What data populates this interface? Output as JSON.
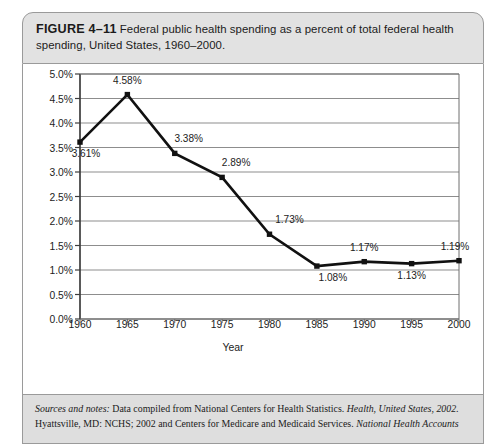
{
  "figure": {
    "label": "FIGURE 4–11",
    "caption": "Federal public health spending as a percent of total federal health spending, United States, 1960–2000."
  },
  "notes": {
    "lead": "Sources and notes:",
    "body_1": " Data compiled from National Centers for Health Statistics. ",
    "italic_1": "Health, United States, 2002.",
    "body_2": " Hyattsville, MD: NCHS; 2002 and Centers for Medicare and Medicaid Services. ",
    "italic_2": "National Health Accounts"
  },
  "chart_data": {
    "type": "line",
    "title": "Federal public health spending as a percent of total federal health spending, United States, 1960–2000.",
    "xlabel": "Year",
    "ylabel": "",
    "categories": [
      "1960",
      "1965",
      "1970",
      "1975",
      "1980",
      "1985",
      "1990",
      "1995",
      "2000"
    ],
    "x": [
      1960,
      1965,
      1970,
      1975,
      1980,
      1985,
      1990,
      1995,
      2000
    ],
    "values": [
      3.61,
      4.58,
      3.38,
      2.89,
      1.73,
      1.08,
      1.17,
      1.13,
      1.19
    ],
    "data_labels": [
      "3.61%",
      "4.58%",
      "3.38%",
      "2.89%",
      "1.73%",
      "1.08%",
      "1.17%",
      "1.13%",
      "1.19%"
    ],
    "label_positions": [
      "below",
      "above",
      "above",
      "above",
      "above",
      "below",
      "above",
      "below",
      "above"
    ],
    "ylim": [
      0.0,
      5.0
    ],
    "ytick_values": [
      0.0,
      0.5,
      1.0,
      1.5,
      2.0,
      2.5,
      3.0,
      3.5,
      4.0,
      4.5,
      5.0
    ],
    "ytick_labels": [
      "0.0%",
      "0.5%",
      "1.0%",
      "1.5%",
      "2.0%",
      "2.5%",
      "3.0%",
      "3.5%",
      "4.0%",
      "4.5%",
      "5.0%"
    ],
    "grid": true,
    "legend": false,
    "series_color": "#111111",
    "marker": "square"
  }
}
